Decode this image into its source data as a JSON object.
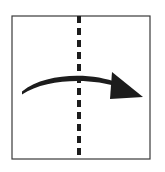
{
  "figure": {
    "title": "Curved arrow crossing a vertical dashed axis",
    "background_color": "#ffffff",
    "canvas": {
      "width": 165,
      "height": 172
    }
  },
  "frame": {
    "name": "panel-border",
    "x": 12,
    "y": 16,
    "width": 138,
    "height": 143,
    "stroke_color": "#3a3a3a",
    "stroke_width": 1.2,
    "fill_color": "#ffffff"
  },
  "axis": {
    "name": "vertical-dashed-axis",
    "label": "symmetry axis",
    "orientation": "vertical",
    "x": 79,
    "y_start": 16,
    "y_end": 159,
    "stroke_color": "#1c1c1c",
    "stroke_width": 4,
    "dash_length": 7,
    "gap_length": 5
  },
  "arrow": {
    "name": "curved-arrow",
    "label": "rotation arrow",
    "direction": "left-to-right",
    "color": "#1c1c1c",
    "shaft": {
      "start": {
        "x": 22,
        "y": 93
      },
      "control_1": {
        "x": 46,
        "y": 74
      },
      "control_2": {
        "x": 92,
        "y": 74
      },
      "end": {
        "x": 118,
        "y": 85
      },
      "stroke_width_start": 3.2,
      "stroke_width_mid": 5.0,
      "stroke_width_end": 4.0
    },
    "head": {
      "name": "arrow-head",
      "points": "112,72 143,97 110,99",
      "tip": {
        "x": 143,
        "y": 97
      },
      "fill_color": "#1c1c1c"
    }
  },
  "annotations": {
    "axis_crossing_point": {
      "x": 79,
      "y": 78
    },
    "arrow_apex": {
      "x": 77,
      "y": 78
    }
  }
}
